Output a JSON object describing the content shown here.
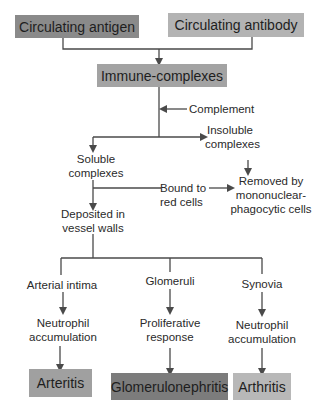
{
  "colors": {
    "dark_box": "#8a8a8a",
    "mid_box": "#a9a9a9",
    "light_box": "#bdbdbd",
    "darkest_box": "#7c7c7c",
    "line": "#4a4a4a"
  },
  "nodes": {
    "circulating_antigen": "Circulating antigen",
    "circulating_antibody": "Circulating antibody",
    "immune_complexes": "Immune-complexes",
    "complement": "Complement",
    "insoluble_1": "Insoluble",
    "insoluble_2": "complexes",
    "soluble_1": "Soluble",
    "soluble_2": "complexes",
    "bound_1": "Bound to",
    "bound_2": "red cells",
    "removed_1": "Removed by",
    "removed_2": "mononuclear-",
    "removed_3": "phagocytic cells",
    "deposited_1": "Deposited in",
    "deposited_2": "vessel walls",
    "arterial_intima": "Arterial intima",
    "glomeruli": "Glomeruli",
    "synovia": "Synovia",
    "neutrophil_left_1": "Neutrophil",
    "neutrophil_left_2": "accumulation",
    "proliferative_1": "Proliferative",
    "proliferative_2": "response",
    "neutrophil_right_1": "Neutrophil",
    "neutrophil_right_2": "accumulation",
    "arteritis": "Arteritis",
    "glomerulonephritis": "Glomerulonephritis",
    "arthritis": "Arthritis"
  }
}
